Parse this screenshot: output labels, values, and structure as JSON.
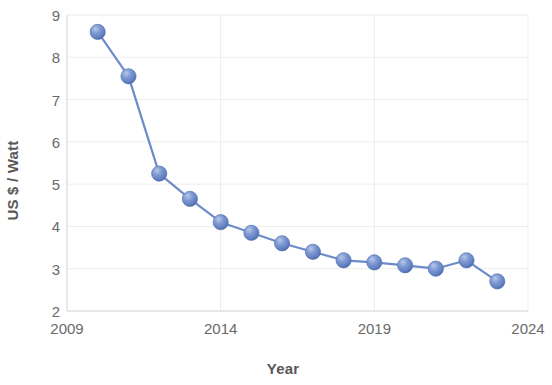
{
  "chart_data": {
    "type": "line",
    "title": "",
    "subtitle": "",
    "xlabel": "Year",
    "ylabel": "US $ / Watt",
    "xlim": [
      2009,
      2024
    ],
    "ylim": [
      2,
      9
    ],
    "x_ticks": [
      2009,
      2014,
      2019,
      2024
    ],
    "x_tick_labels": [
      "2009",
      "2014",
      "2019",
      "2024"
    ],
    "y_ticks": [
      2,
      3,
      4,
      5,
      6,
      7,
      8,
      9
    ],
    "y_tick_labels": [
      "2",
      "3",
      "4",
      "5",
      "6",
      "7",
      "8",
      "9"
    ],
    "grid": "faint horizontal and vertical gridlines",
    "legend": "none",
    "marker_style": "3d-sphere",
    "series": [
      {
        "name": "US $ / Watt",
        "line_color": "#6b8bc9",
        "marker_color": "#6f8ccc",
        "x": [
          2010,
          2011,
          2012,
          2013,
          2014,
          2015,
          2016,
          2017,
          2018,
          2019,
          2020,
          2021,
          2022,
          2023
        ],
        "values": [
          8.6,
          7.55,
          5.25,
          4.65,
          4.1,
          3.85,
          3.6,
          3.4,
          3.2,
          3.15,
          3.08,
          3.0,
          3.2,
          2.7
        ]
      }
    ]
  },
  "colors": {
    "marker_light": "#93abdc",
    "marker_mid": "#6f8ccc",
    "marker_dark": "#4e6fb5",
    "line": "#6b8bc9",
    "text": "#5d5d5d",
    "tick_text": "#6a6a6a",
    "grid": "#ededed",
    "axis": "#d9d9d9",
    "background": "#ffffff"
  },
  "axes": {
    "y_title": "US $ / Watt",
    "x_title": "Year"
  }
}
